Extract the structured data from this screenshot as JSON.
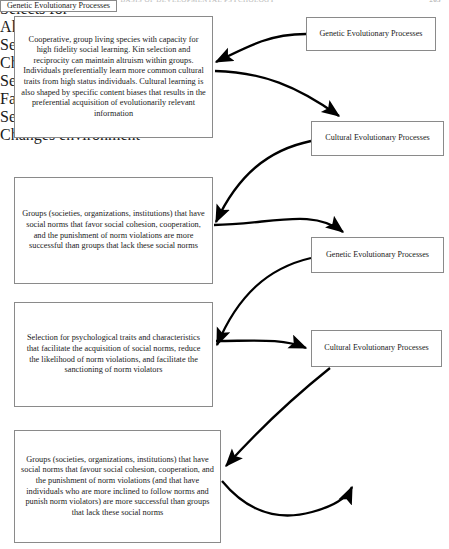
{
  "page": {
    "header_title": "THE EVOLUTIONARY BASIS OF DEVELOPMENTAL PSYCHOLOGY",
    "page_number": "265"
  },
  "diagram": {
    "type": "flow-diagram",
    "nodes": [
      {
        "id": "box-species",
        "column": "left",
        "label": "Cooperative, group living species with capacity for high fidelity social learning. Kin selection and reciprocity can maintain altruism within groups. Individuals preferentially learn more common cultural traits from high status individuals. Cultural learning is also shaped by specific content biases that results in the preferential acquisition of evolutionarily relevant information"
      },
      {
        "id": "box-gen-1",
        "column": "right",
        "label": "Genetic Evolutionary Processes"
      },
      {
        "id": "box-cul-1",
        "column": "right",
        "label": "Cultural Evolutionary Processes"
      },
      {
        "id": "box-groups-1",
        "column": "left",
        "label": "Groups (societies, organizations, institutions) that have social norms that favor social cohesion, cooperation, and the punishment of norm violations are more successful than groups that lack these social norms"
      },
      {
        "id": "box-gen-2",
        "column": "right",
        "label": "Genetic Evolutionary Processes"
      },
      {
        "id": "box-selection",
        "column": "left",
        "label": "Selection for psychological traits and characteristics that facilitate the acquisition of social norms, reduce the likelihood of norm violations, and facilitate the sanctioning of norm violators"
      },
      {
        "id": "box-cul-2",
        "column": "right",
        "label": "Cultural Evolutionary Processes"
      },
      {
        "id": "box-groups-2",
        "column": "left",
        "label": "Groups (societies, organizations, institutions) that have social norms that favour social cohesion, cooperation, and the punishment of norm violations (and that have individuals who are more inclined to follow norms and punish norm violators) are more successful than groups that lack these social norms"
      },
      {
        "id": "box-gen-3",
        "column": "right",
        "label": "Genetic Evolutionary Processes"
      }
    ],
    "edges": [
      {
        "id": "edge-selects-1",
        "from": "box-gen-1",
        "to": "box-species",
        "label": "Selects for"
      },
      {
        "id": "edge-allows",
        "from": "box-species",
        "to": "box-cul-1",
        "label": "Allows for"
      },
      {
        "id": "edge-selects-2",
        "from": "box-cul-1",
        "to": "box-groups-1",
        "label": "Selects for"
      },
      {
        "id": "edge-changes-1",
        "from": "box-groups-1",
        "to": "box-gen-2",
        "label": "Changes environment"
      },
      {
        "id": "edge-selects-3",
        "from": "box-gen-2",
        "to": "box-selection",
        "label": "Selects for"
      },
      {
        "id": "edge-facilitates",
        "from": "box-selection",
        "to": "box-cul-2",
        "label": "Facilitates"
      },
      {
        "id": "edge-selects-4",
        "from": "box-cul-2",
        "to": "box-groups-2",
        "label": "Selects for"
      },
      {
        "id": "edge-changes-2",
        "from": "box-groups-2",
        "to": "box-gen-3",
        "label": "Changes environment"
      }
    ],
    "colors": {
      "box_border": "#8a8a8a",
      "arrow": "#000000",
      "text": "#1a1a1a",
      "background": "#ffffff"
    }
  }
}
